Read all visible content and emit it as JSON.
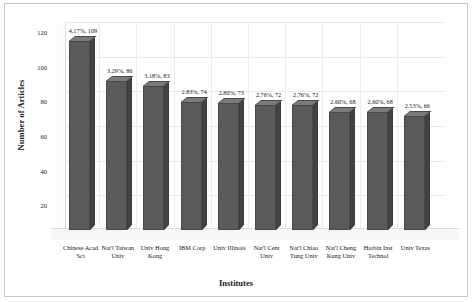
{
  "chart_data": {
    "type": "bar",
    "title": "",
    "xlabel": "Institutes",
    "ylabel": "Number of Articles",
    "ylim": [
      0,
      120
    ],
    "yticks": [
      0,
      20,
      40,
      60,
      80,
      100,
      120
    ],
    "ytick_labels": [
      "0",
      "20",
      "40",
      "60",
      "80",
      "100",
      "120"
    ],
    "grid": true,
    "legend": "none",
    "bar_color": "#5a5a5a",
    "categories": [
      "Chinese Acad Sci",
      "Nat'l Taiwan Univ",
      "Univ Hong Kong",
      "IBM Corp",
      "Univ Illinois",
      "Nat'l Cent Univ",
      "Nat'l Chiao Tung Univ",
      "Nat'l Cheng Kung Univ",
      "Harbin Inst Technol",
      "Univ Texas"
    ],
    "category_lines": [
      [
        "Chinese Acad",
        "Sci"
      ],
      [
        "Nat'l Taiwan",
        "Univ"
      ],
      [
        "Univ Hong",
        "Kong"
      ],
      [
        "IBM Corp",
        ""
      ],
      [
        "Univ Illinois",
        ""
      ],
      [
        "Nat'l Cent",
        "Univ"
      ],
      [
        "Nat'l Chiao",
        "Tung Univ"
      ],
      [
        "Nat'l Cheng",
        "Kung Univ"
      ],
      [
        "Harbin Inst",
        "Technol"
      ],
      [
        "Univ Texas",
        ""
      ]
    ],
    "values": [
      109,
      86,
      83,
      74,
      73,
      72,
      72,
      68,
      68,
      66
    ],
    "percents": [
      "4.17%",
      "3.29%",
      "3.18%",
      "2.83%",
      "2.80%",
      "2.76%",
      "2.76%",
      "2.60%",
      "2.60%",
      "2.53%"
    ],
    "data_labels": [
      "4.17%, 109",
      "3.29%, 86",
      "3.18%, 83",
      "2.83%, 74",
      "2.80%, 73",
      "2.76%, 72",
      "2.76%, 72",
      "2.60%, 68",
      "2.60%, 68",
      "2.53%, 66"
    ]
  }
}
